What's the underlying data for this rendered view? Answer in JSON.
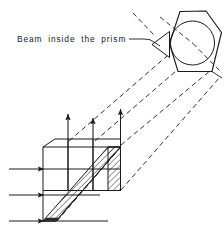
{
  "figure": {
    "title": "Beam inside the prism",
    "kind": "optical-ray-diagram",
    "background_color": "#ffffff",
    "line_color": "#1a1a1a",
    "hatch_color": "#2b2b2b",
    "canvas": {
      "width": 224,
      "height": 234
    }
  },
  "annotations": {
    "beam_label": "Beam inside the prism"
  },
  "labels": {
    "beam_label_position": {
      "x": 17,
      "y": 42
    },
    "leader_line": "from label right edge to prism left vertex"
  },
  "prism": {
    "name": "pentaprism",
    "outline_points": "169,43 179,12 205,11 221,32 212,71 178,72",
    "inscribed_circle": {
      "cx": 193,
      "cy": 43,
      "r": 22
    },
    "entrance_face_notch": "152,44 169,31 169,57",
    "internal_rays": [
      "160,17 193,43",
      "193,43 221,72"
    ]
  },
  "beam_block": {
    "description": "hatched parallelepiped representing the beam cross-section",
    "top_face": "43,147 55,139 120,139 108,147",
    "front_face": "43,147 108,147 108,190 43,190",
    "hatched_face": "43,221 108,147 120,147 56,221",
    "hatch_angle_deg": 45,
    "hatch_spacing_px": 3
  },
  "rays": {
    "incoming_arrow_count": 3,
    "outgoing_arrow_count": 3,
    "incoming_arrows": [
      {
        "x1": 10,
        "y1": 169,
        "x2": 46,
        "y2": 169
      },
      {
        "x1": 10,
        "y1": 195,
        "x2": 46,
        "y2": 195
      },
      {
        "x1": 10,
        "y1": 221,
        "x2": 46,
        "y2": 221
      }
    ],
    "outgoing_arrows": [
      {
        "x1": 68,
        "y1": 190,
        "x2": 68,
        "y2": 112
      },
      {
        "x1": 93,
        "y1": 190,
        "x2": 93,
        "y2": 116
      },
      {
        "x1": 120,
        "y1": 190,
        "x2": 120,
        "y2": 107
      }
    ],
    "projection_lines": [
      "70,140 168,55",
      "96,140 190,60",
      "122,146 215,70",
      "122,172 218,84",
      "152,33 133,13"
    ],
    "style": "dashed"
  },
  "colors": {
    "stroke": "#1a1a1a",
    "hatch": "#2b2b2b",
    "background": "#ffffff"
  }
}
